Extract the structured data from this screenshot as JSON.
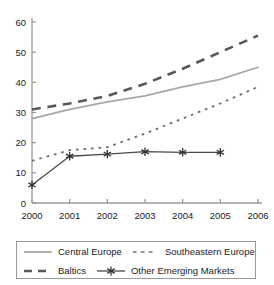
{
  "chart_data": {
    "type": "line",
    "title": "",
    "subtitle": "",
    "xlabel": "",
    "ylabel": "",
    "categories": [
      "2000",
      "2001",
      "2002",
      "2003",
      "2004",
      "2005",
      "2006"
    ],
    "x": [
      2000,
      2001,
      2002,
      2003,
      2004,
      2005,
      2006
    ],
    "xlim": [
      2000,
      2006
    ],
    "ylim": [
      0,
      60
    ],
    "yticks": [
      0,
      10,
      20,
      30,
      40,
      50,
      60
    ],
    "ytick_labels": [
      "0",
      "10",
      "20",
      "30",
      "40",
      "50",
      "60"
    ],
    "xtick_labels": [
      "2000",
      "2001",
      "2002",
      "2003",
      "2004",
      "2005",
      "2006"
    ],
    "grid": false,
    "legend_position": "bottom",
    "series": [
      {
        "name": "Central Europe",
        "style": "solid",
        "color": "#a8a8a8",
        "marker": "none",
        "values": [
          28,
          31,
          33.5,
          35.5,
          38.5,
          41,
          45
        ]
      },
      {
        "name": "Southeastern Europe",
        "style": "dotted",
        "color": "#6e6e6e",
        "marker": "none",
        "values": [
          14,
          17.5,
          18.5,
          23,
          28,
          33,
          38.5
        ]
      },
      {
        "name": "Baltics",
        "style": "dashed",
        "color": "#585858",
        "marker": "none",
        "values": [
          31,
          33,
          35.5,
          39.5,
          44.5,
          50,
          55.5
        ]
      },
      {
        "name": "Other Emerging Markets",
        "style": "solid",
        "color": "#4a4a4a",
        "marker": "asterisk",
        "values": [
          6,
          15.5,
          16.2,
          17,
          16.8,
          16.8,
          null
        ]
      }
    ]
  },
  "legend": {
    "entries": [
      {
        "label": "Central Europe"
      },
      {
        "label": "Southeastern Europe"
      },
      {
        "label": "Baltics"
      },
      {
        "label": "Other Emerging Markets"
      }
    ]
  },
  "colors": {
    "central_europe": "#a8a8a8",
    "southeastern_europe": "#6e6e6e",
    "baltics": "#585858",
    "other_emerging_markets": "#4a4a4a",
    "axis": "#9a9a9a",
    "text": "#1a1a1a"
  }
}
